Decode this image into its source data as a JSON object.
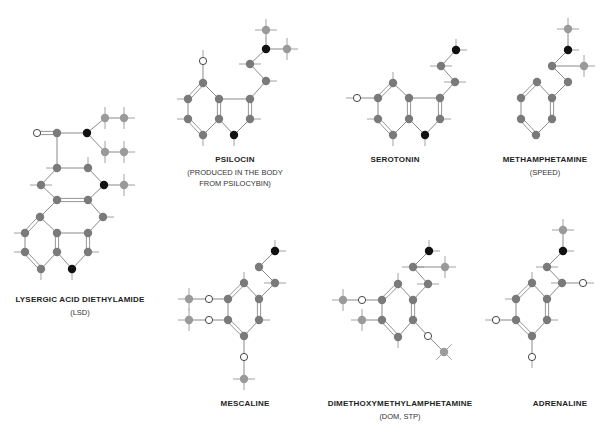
{
  "diagram": {
    "molecules": [
      {
        "id": "lsd",
        "name": "LYSERGIC ACID DIETHYLAMIDE",
        "subtitle": [
          "(LSD)"
        ]
      },
      {
        "id": "psilocin",
        "name": "PSILOCIN",
        "subtitle": [
          "(PRODUCED IN THE BODY",
          "FROM PSILOCYBIN)"
        ]
      },
      {
        "id": "serotonin",
        "name": "SEROTONIN",
        "subtitle": []
      },
      {
        "id": "methamphetamine",
        "name": "METHAMPHETAMINE",
        "subtitle": [
          "(SPEED)"
        ]
      },
      {
        "id": "mescaline",
        "name": "MESCALINE",
        "subtitle": []
      },
      {
        "id": "dom",
        "name": "DIMETHOXYMETHYLAMPHETAMINE",
        "subtitle": [
          "(DOM, STP)"
        ]
      },
      {
        "id": "adrenaline",
        "name": "ADRENALINE",
        "subtitle": []
      }
    ],
    "atom_legend": {
      "carbon": {
        "symbol": "C",
        "color": "#7a7a7a"
      },
      "nitrogen": {
        "symbol": "N",
        "color": "#111111"
      },
      "oxygen": {
        "symbol": "O",
        "color": "#ffffff"
      },
      "methyl_carbon": {
        "symbol": "C",
        "color": "#9a9a9a"
      }
    },
    "colors": {
      "bond": "#8a8a8a",
      "hydrogen_stub": "#8a8a8a",
      "text": "#1e1e1e"
    }
  }
}
